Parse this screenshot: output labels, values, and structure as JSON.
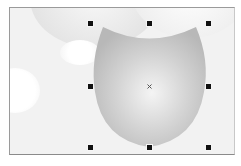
{
  "canvas": {
    "background": "#f2f2f2",
    "border_color": "#9a9a9a"
  },
  "selected_shape": {
    "type": "shield",
    "fill_gradient": [
      "#f4f4f4",
      "#cfcfcf",
      "#b9b9b9"
    ],
    "bounding_box": {
      "x": 92,
      "y": 23,
      "width": 116,
      "height": 124
    }
  },
  "handles": [
    {
      "id": "top-left",
      "x": 90,
      "y": 23
    },
    {
      "id": "top-center",
      "x": 149,
      "y": 23
    },
    {
      "id": "top-right",
      "x": 208,
      "y": 23
    },
    {
      "id": "middle-left",
      "x": 90,
      "y": 86
    },
    {
      "id": "middle-right",
      "x": 208,
      "y": 86
    },
    {
      "id": "bottom-left",
      "x": 90,
      "y": 147
    },
    {
      "id": "bottom-center",
      "x": 149,
      "y": 147
    },
    {
      "id": "bottom-right",
      "x": 208,
      "y": 147
    }
  ],
  "center_marker": {
    "x": 149,
    "y": 86,
    "glyph": "×"
  }
}
